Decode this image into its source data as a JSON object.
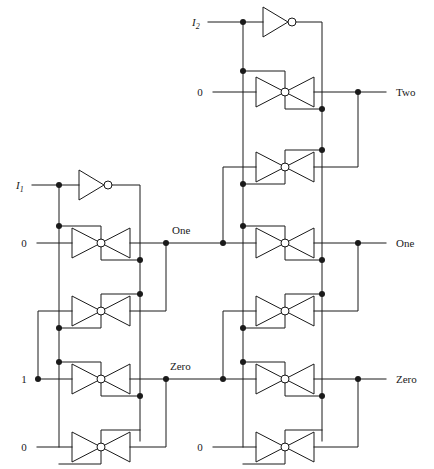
{
  "figure": {
    "type": "logic-circuit-schematic",
    "ink_color": "#1a1a1a",
    "background": "#ffffff"
  },
  "inputs": {
    "left_stage": [
      {
        "id": "i1",
        "label": "I",
        "subscript": "1",
        "italic": true,
        "x": 20,
        "y": 185
      },
      {
        "id": "left-zero",
        "label": "0",
        "subscript": "",
        "italic": false,
        "x": 25,
        "y": 243
      },
      {
        "id": "left-one",
        "label": "1",
        "subscript": "",
        "italic": false,
        "x": 25,
        "y": 379
      },
      {
        "id": "left-zero2",
        "label": "0",
        "subscript": "",
        "italic": false,
        "x": 25,
        "y": 447
      }
    ],
    "right_stage": [
      {
        "id": "i2",
        "label": "I",
        "subscript": "2",
        "italic": true,
        "x": 196,
        "y": 22
      },
      {
        "id": "right-zero",
        "label": "0",
        "subscript": "",
        "italic": false,
        "x": 201,
        "y": 92
      },
      {
        "id": "right-zero2",
        "label": "0",
        "subscript": "",
        "italic": false,
        "x": 201,
        "y": 447
      }
    ]
  },
  "intermediate_labels": [
    {
      "id": "mid-one",
      "label": "One",
      "x": 172,
      "y": 233
    },
    {
      "id": "mid-zero",
      "label": "Zero",
      "x": 170,
      "y": 369
    }
  ],
  "outputs": [
    {
      "id": "out-two",
      "label": "Two",
      "x": 396,
      "y": 92
    },
    {
      "id": "out-one",
      "label": "One",
      "x": 396,
      "y": 243
    },
    {
      "id": "out-zero",
      "label": "Zero",
      "x": 396,
      "y": 379
    }
  ],
  "inverters": [
    {
      "id": "inverter-i1",
      "input_signal": "I1",
      "x": 70,
      "y": 185
    },
    {
      "id": "inverter-i2",
      "input_signal": "I2",
      "x": 262,
      "y": 22
    }
  ],
  "transmission_gates": {
    "count": 8,
    "left_stage": [
      {
        "id": "tg-left-1",
        "y": 243,
        "row": "one-upper"
      },
      {
        "id": "tg-left-2",
        "y": 311,
        "row": "one-lower"
      },
      {
        "id": "tg-left-3",
        "y": 379,
        "row": "zero-upper"
      },
      {
        "id": "tg-left-4",
        "y": 447,
        "row": "zero-lower"
      }
    ],
    "right_stage": [
      {
        "id": "tg-right-1",
        "y": 92,
        "row": "two-upper"
      },
      {
        "id": "tg-right-2",
        "y": 167,
        "row": "two-lower"
      },
      {
        "id": "tg-right-3",
        "y": 243,
        "row": "one-upper"
      },
      {
        "id": "tg-right-4",
        "y": 311,
        "row": "one-lower"
      },
      {
        "id": "tg-right-5",
        "y": 379,
        "row": "zero-upper"
      },
      {
        "id": "tg-right-6",
        "y": 447,
        "row": "zero-lower"
      }
    ]
  }
}
